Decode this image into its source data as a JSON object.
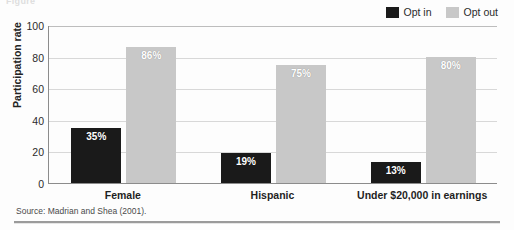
{
  "caption_remnant": "Figure",
  "legend": {
    "position": "top-right",
    "items": [
      {
        "label": "Opt in",
        "color": "#1a1a1a",
        "icon": "legend-swatch-icon"
      },
      {
        "label": "Opt out",
        "color": "#c8c8c8",
        "icon": "legend-swatch-icon"
      }
    ]
  },
  "source": "Source: Madrian and Shea (2001).",
  "chart_data": {
    "type": "bar",
    "title": "",
    "subtitle": "",
    "xlabel": "",
    "ylabel": "Participation rate",
    "ylim": [
      0,
      100
    ],
    "yticks": [
      0,
      20,
      40,
      60,
      80,
      100
    ],
    "ytick_labels": [
      "0",
      "20",
      "40",
      "60",
      "80",
      "100"
    ],
    "grid": true,
    "legend_position": "top-right",
    "categories": [
      "Female",
      "Hispanic",
      "Under $20,000 in earnings"
    ],
    "series": [
      {
        "name": "Opt in",
        "color": "#1a1a1a",
        "values": [
          35,
          19,
          13
        ],
        "labels": [
          "35%",
          "19%",
          "13%"
        ]
      },
      {
        "name": "Opt out",
        "color": "#c8c8c8",
        "values": [
          86,
          75,
          80
        ],
        "labels": [
          "86%",
          "75%",
          "80%"
        ]
      }
    ]
  }
}
